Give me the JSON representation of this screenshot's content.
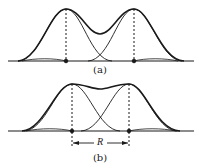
{
  "panels": [
    {
      "id": "a",
      "caption": "(a)",
      "description": "Two overlapping Gaussian peaks, well separated; sum curve shows a distinct dip between peaks"
    },
    {
      "id": "b",
      "caption": "(b)",
      "description": "Two overlapping Gaussian peaks at the resolution limit; sum curve shows a shallow dip",
      "separation_label": "R"
    }
  ],
  "colors": {
    "line": "#1a1a1a",
    "background": "#ffffff"
  }
}
